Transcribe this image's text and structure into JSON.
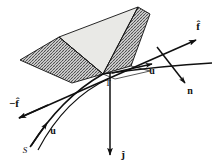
{
  "figure": {
    "background_color": "#ffffff",
    "ink_color": "#101010",
    "face_fill_color": "#e9e9e6",
    "hatch_color": "#4a4a4a"
  },
  "labels": {
    "f_hat_right": "f̂",
    "f_hat_left": "−f̂",
    "u_right": "u",
    "u_left": "u",
    "n_right": "n",
    "j_hat_bottom": "ĵ",
    "vertex_T": "T",
    "point_S": "S"
  },
  "label_positions": {
    "f_hat_right": {
      "x": 198,
      "y": 30
    },
    "f_hat_left": {
      "x": 14,
      "y": 107
    },
    "u_right": {
      "x": 152,
      "y": 72
    },
    "u_left": {
      "x": 52,
      "y": 133
    },
    "n_right": {
      "x": 189,
      "y": 92
    },
    "j_hat_bottom": {
      "x": 122,
      "y": 157
    },
    "vertex_T": {
      "x": 108,
      "y": 84
    },
    "point_S": {
      "x": 26,
      "y": 151
    }
  },
  "geometry": {
    "vertex_T": {
      "x": 103,
      "y": 74
    },
    "wedge_apex_top": {
      "x": 138,
      "y": 7
    },
    "wedge_left_back": {
      "x": 59,
      "y": 37
    },
    "wedge_left_far": {
      "x": 20,
      "y": 60
    },
    "wedge_bottom_left": {
      "x": 40,
      "y": 73
    },
    "wedge_right_top": {
      "x": 150,
      "y": 14
    },
    "wedge_right_bottom": {
      "x": 131,
      "y": 66
    },
    "f_hat_arrow_tip": {
      "x": 196,
      "y": 40
    },
    "neg_f_hat_arrow_tip": {
      "x": 19,
      "y": 118
    },
    "u_right_arrow_tip": {
      "x": 152,
      "y": 64
    },
    "u_left_arrow_tip": {
      "x": 46,
      "y": 124
    },
    "n_arrow_tip": {
      "x": 185,
      "y": 83
    },
    "j_arrow_tip": {
      "x": 110,
      "y": 155
    }
  },
  "elements": {
    "hatched_left_face": "left hatched parallelogram face of wedge",
    "hatched_right_face": "right hatched parallelogram face of wedge",
    "shaded_top_face": "light gray upper triangular face of wedge",
    "straight_line_f": "straight line through T along f-hat direction",
    "curve_u": "curved trajectory through T tangent to u",
    "vertical_axis_j": "vertical downward arrow labeled j-hat"
  }
}
